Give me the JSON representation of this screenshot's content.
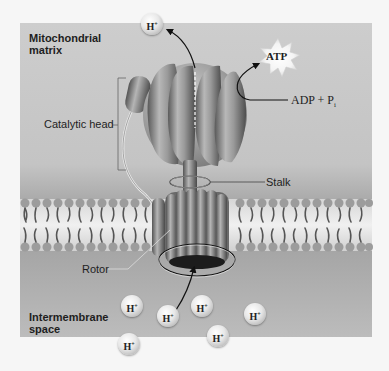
{
  "figure": {
    "colors": {
      "matrix_bg": "#c8c8c8",
      "intermembrane_bg_top": "#9a9a9a",
      "intermembrane_bg_bottom": "#b9b9b9",
      "membrane": "#d9d9d9",
      "protein": "#8a8a8a",
      "page_bg": "#f6f6f6"
    }
  },
  "regions": {
    "matrix_label_line1": "Mitochondrial",
    "matrix_label_line2": "matrix",
    "intermembrane_label_line1": "Intermembrane",
    "intermembrane_label_line2": "space"
  },
  "labels": {
    "catalytic_head": "Catalytic head",
    "stalk": "Stalk",
    "rotor": "Rotor"
  },
  "reaction": {
    "product": "ATP",
    "reactants": "ADP + P",
    "reactant_subscript": "i"
  },
  "ions": {
    "symbol": "H",
    "charge": "+",
    "positions": [
      {
        "id": "matrix-exit",
        "x": 152,
        "y": 24
      },
      {
        "id": "ims-1",
        "x": 132,
        "y": 306
      },
      {
        "id": "ims-2",
        "x": 168,
        "y": 316
      },
      {
        "id": "ims-3",
        "x": 202,
        "y": 306
      },
      {
        "id": "ims-4",
        "x": 255,
        "y": 314
      },
      {
        "id": "ims-5",
        "x": 218,
        "y": 336
      },
      {
        "id": "ims-6",
        "x": 129,
        "y": 344
      }
    ]
  }
}
